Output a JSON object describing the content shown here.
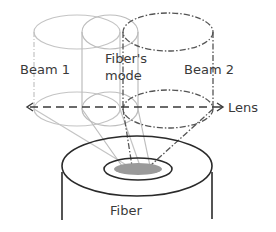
{
  "diagram": {
    "labels": {
      "beam1": "Beam 1",
      "fiber_mode_line1": "Fiber's",
      "fiber_mode_line2": "mode",
      "beam2": "Beam 2",
      "lens": "Lens",
      "fiber": "Fiber"
    },
    "colors": {
      "beam1_stroke": "#c4c4c4",
      "mode_stroke": "#bdbdbd",
      "beam2_stroke": "#555555",
      "lens_stroke": "#3a3a3a",
      "fiber_stroke": "#2a2a2a",
      "core_fill": "#9a9a9a",
      "text": "#3a3a3a"
    }
  }
}
